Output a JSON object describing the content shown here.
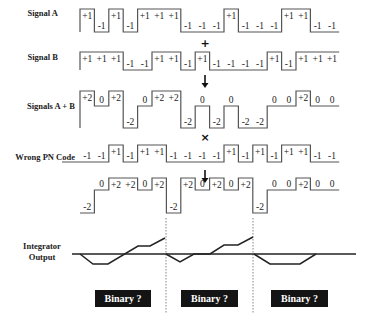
{
  "layout": {
    "x0": 80,
    "chip_width": 14.4
  },
  "rows": [
    {
      "id": "signal-a",
      "label": "Signal A",
      "label_x": 58,
      "label_y": 16,
      "levels": {
        "+1": 9,
        "-1": 32
      },
      "values": [
        "+1",
        "-1",
        "+1",
        "-1",
        "+1",
        "+1",
        "+1",
        "-1",
        "-1",
        "-1",
        "+1",
        "-1",
        "-1",
        "-1",
        "+1",
        "+1",
        "-1",
        "-1"
      ]
    },
    {
      "id": "signal-b",
      "label": "Signal B",
      "label_x": 58,
      "label_y": 60,
      "levels": {
        "+1": 52,
        "-1": 70
      },
      "values": [
        "+1",
        "+1",
        "+1",
        "-1",
        "-1",
        "+1",
        "+1",
        "-1",
        "+1",
        "-1",
        "-1",
        "-1",
        "-1",
        "+1",
        "-1",
        "+1",
        "+1",
        "+1"
      ]
    },
    {
      "id": "signals-a-plus-b",
      "label": "Signals A + B",
      "label_x": 75,
      "label_y": 109,
      "levels": {
        "+2": 91,
        "0": 106,
        "-2": 128
      },
      "values": [
        "+2",
        "0",
        "+2",
        "-2",
        "0",
        "+2",
        "+2",
        "-2",
        "0",
        "-2",
        "0",
        "-2",
        "-2",
        "0",
        "0",
        "+2",
        "0",
        "0"
      ]
    },
    {
      "id": "wrong-pn-code",
      "label": "Wrong PN Code",
      "label_x": 75,
      "label_y": 160,
      "levels": {
        "+1": 145,
        "-1": 162
      },
      "lead_in": 62,
      "values": [
        "-1",
        "-1",
        "+1",
        "-1",
        "+1",
        "+1",
        "-1",
        "-1",
        "-1",
        "-1",
        "+1",
        "-1",
        "+1",
        "-1",
        "+1",
        "+1",
        "-1",
        "-1"
      ]
    },
    {
      "id": "despread-product",
      "label": "",
      "levels": {
        "+2": 178,
        "0": 190,
        "-2": 213
      },
      "values": [
        "-2",
        "0",
        "+2",
        "+2",
        "0",
        "+2",
        "-2",
        "+2",
        "0",
        "+2",
        "0",
        "+2",
        "-2",
        "0",
        "0",
        "+2",
        "0",
        "0"
      ]
    }
  ],
  "operators": [
    {
      "id": "plus-operator",
      "symbol": "+",
      "x": 205,
      "y": 47
    },
    {
      "id": "times-operator",
      "symbol": "×",
      "x": 205,
      "y": 141
    }
  ],
  "arrows": [
    {
      "id": "down-arrow-1",
      "x": 205,
      "y1": 75,
      "y2": 88
    },
    {
      "id": "down-arrow-2",
      "x": 205,
      "y1": 170,
      "y2": 183
    }
  ],
  "integrator": {
    "label_line1": "Integrator",
    "label_line2": "Output",
    "baseline_y": 254,
    "baseline_x1": 72,
    "baseline_x2": 356,
    "traces": [
      [
        [
          80,
          254
        ],
        [
          93,
          264
        ],
        [
          108,
          264
        ],
        [
          138,
          246
        ],
        [
          150,
          246
        ],
        [
          165,
          238
        ]
      ],
      [
        [
          166,
          254
        ],
        [
          180,
          262
        ],
        [
          194,
          254
        ],
        [
          210,
          254
        ],
        [
          224,
          245
        ],
        [
          238,
          245
        ],
        [
          253,
          237
        ]
      ],
      [
        [
          254,
          254
        ],
        [
          270,
          264
        ],
        [
          300,
          264
        ],
        [
          316,
          254
        ]
      ]
    ],
    "dividers": [
      166,
      253
    ],
    "divider_y1": 218,
    "divider_y2": 314
  },
  "binary_boxes": [
    {
      "id": "binary-box-1",
      "label": "Binary ?",
      "x": 95,
      "y": 290,
      "w": 56,
      "h": 17
    },
    {
      "id": "binary-box-2",
      "label": "Binary ?",
      "x": 181,
      "y": 290,
      "w": 57,
      "h": 17
    },
    {
      "id": "binary-box-3",
      "label": "Binary ?",
      "x": 271,
      "y": 290,
      "w": 57,
      "h": 17
    }
  ]
}
